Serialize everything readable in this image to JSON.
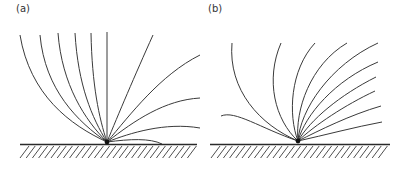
{
  "figure": {
    "panels": [
      {
        "id": "a",
        "label": "(a)",
        "description": "Field lines fanning out from a point source on a hatched ground surface, bending toward the right",
        "line_count": 11
      },
      {
        "id": "b",
        "label": "(b)",
        "description": "Field lines fanning out from a point source on a hatched ground surface, swept toward the upper right",
        "line_count": 11
      }
    ],
    "colors": {
      "line": "#3a3a3a",
      "ground": "#2a2a2a",
      "background": "#ffffff"
    }
  }
}
